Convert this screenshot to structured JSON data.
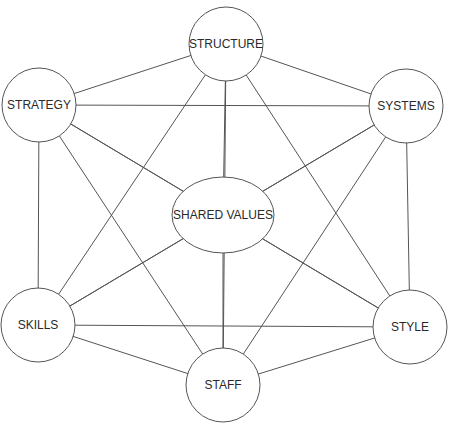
{
  "diagram": {
    "colors": {
      "stroke": "#555555",
      "fill": "#ffffff",
      "text": "#2a2a2a"
    },
    "nodes": [
      {
        "id": "structure",
        "label": "STRUCTURE",
        "shape": "circle",
        "cx": 226,
        "cy": 44,
        "rx": 37,
        "ry": 37
      },
      {
        "id": "strategy",
        "label": "STRATEGY",
        "shape": "circle",
        "cx": 39,
        "cy": 105,
        "rx": 37,
        "ry": 37
      },
      {
        "id": "systems",
        "label": "SYSTEMS",
        "shape": "circle",
        "cx": 406,
        "cy": 106,
        "rx": 37,
        "ry": 37
      },
      {
        "id": "shared_values",
        "label": "SHARED VALUES",
        "shape": "ellipse",
        "cx": 223,
        "cy": 215,
        "rx": 51,
        "ry": 38
      },
      {
        "id": "skills",
        "label": "SKILLS",
        "shape": "circle",
        "cx": 38,
        "cy": 325,
        "rx": 37,
        "ry": 37
      },
      {
        "id": "style",
        "label": "STYLE",
        "shape": "circle",
        "cx": 410,
        "cy": 327,
        "rx": 37,
        "ry": 37
      },
      {
        "id": "staff",
        "label": "STAFF",
        "shape": "circle",
        "cx": 223,
        "cy": 385,
        "rx": 37,
        "ry": 37
      }
    ],
    "edges": [
      [
        "structure",
        "strategy"
      ],
      [
        "structure",
        "systems"
      ],
      [
        "structure",
        "shared_values"
      ],
      [
        "structure",
        "skills"
      ],
      [
        "structure",
        "style"
      ],
      [
        "structure",
        "staff"
      ],
      [
        "strategy",
        "systems"
      ],
      [
        "strategy",
        "shared_values"
      ],
      [
        "strategy",
        "skills"
      ],
      [
        "strategy",
        "style"
      ],
      [
        "strategy",
        "staff"
      ],
      [
        "systems",
        "shared_values"
      ],
      [
        "systems",
        "skills"
      ],
      [
        "systems",
        "style"
      ],
      [
        "systems",
        "staff"
      ],
      [
        "shared_values",
        "skills"
      ],
      [
        "shared_values",
        "style"
      ],
      [
        "shared_values",
        "staff"
      ],
      [
        "skills",
        "style"
      ],
      [
        "skills",
        "staff"
      ],
      [
        "style",
        "staff"
      ]
    ]
  }
}
